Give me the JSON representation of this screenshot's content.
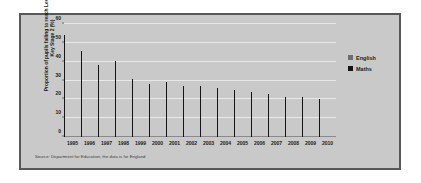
{
  "chart_data": {
    "type": "bar",
    "title": "",
    "subtitle": "",
    "xlabel": "",
    "ylabel": "Proportion of pupils failing to reach Level 4 at Key Stage 2 (%)",
    "ylim": [
      0,
      60
    ],
    "ytick_values": [
      0,
      10,
      20,
      30,
      40,
      50,
      60
    ],
    "ytick_labels": [
      "0",
      "10",
      "20",
      "30",
      "40",
      "50",
      "60"
    ],
    "grid": true,
    "legend_position": "right",
    "categories": [
      "1995",
      "1996",
      "1997",
      "1998",
      "1999",
      "2000",
      "2001",
      "2002",
      "2003",
      "2004",
      "2005",
      "2006",
      "2007",
      "2008",
      "2009",
      "2010"
    ],
    "series": [
      {
        "name": "English",
        "color": "#6e6e6e",
        "values": [
          50.5,
          42,
          37,
          34.5,
          29,
          25,
          25,
          25,
          25,
          22,
          21,
          21,
          20,
          19,
          20,
          19
        ]
      },
      {
        "name": "Maths",
        "color": "#141414",
        "values": [
          54,
          45.5,
          38,
          40.5,
          31,
          28,
          29,
          27,
          27,
          26,
          25,
          24,
          23,
          21,
          21,
          20
        ]
      }
    ],
    "source_note": "Source: Department for Education; the data is for England"
  },
  "legend": {
    "items": [
      {
        "label": "English",
        "swatch": "english"
      },
      {
        "label": "Maths",
        "swatch": "maths"
      }
    ]
  },
  "colors": {
    "english_bar": "#6e6e6e",
    "maths_bar": "#141414",
    "plot_background": "#c9c9c9",
    "gridline": "#e8e8e8",
    "frame_border": "#58585a",
    "page_background": "#ffffff"
  }
}
